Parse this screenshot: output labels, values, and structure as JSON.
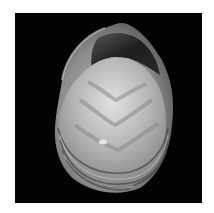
{
  "image": {
    "subject": "bivalve shell photographed on black background",
    "background_color": "#ffffff",
    "frame_color": "#030303",
    "palette": {
      "shell_light": "#d8d8d8",
      "shell_mid": "#9a9a9a",
      "shell_dark": "#3a3a3a",
      "interior_dark": "#1c1c1c"
    }
  }
}
